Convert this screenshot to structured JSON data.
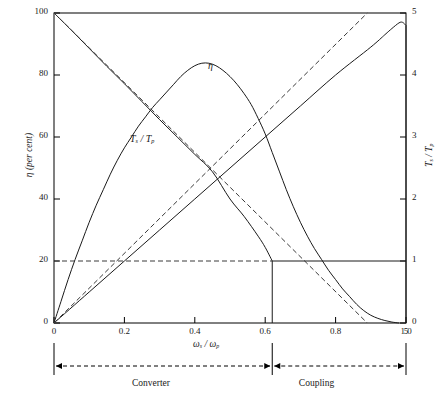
{
  "chart_data": {
    "type": "line",
    "title": "",
    "xlabel": "ωₛ / ωₚ",
    "ylabel": "η (per cent)",
    "ylabel_right": "Tₛ / Tₚ",
    "xlim": [
      0,
      1.0
    ],
    "ylim": [
      0,
      100
    ],
    "ylim_right": [
      0,
      5
    ],
    "grid": false,
    "legend": "in-plot curve labels",
    "x_ticks": [
      "0",
      "0.2",
      "0.4",
      "0.6",
      "0.8",
      "1.0"
    ],
    "x_tick_values": [
      0,
      0.2,
      0.4,
      0.6,
      0.8,
      1.0
    ],
    "y_ticks_left": [
      "0",
      "20",
      "40",
      "60",
      "80",
      "100"
    ],
    "y_tick_values_left": [
      0,
      20,
      40,
      60,
      80,
      100
    ],
    "y_ticks_right": [
      "0",
      "1",
      "2",
      "3",
      "4",
      "5"
    ],
    "y_tick_values_right": [
      0,
      1,
      2,
      3,
      4,
      5
    ],
    "series": [
      {
        "name": "η",
        "style": "solid",
        "axis": "left",
        "label": "η",
        "label_x": 0.52,
        "label_y": 82,
        "points": [
          [
            0.0,
            0.0
          ],
          [
            0.02,
            7.0
          ],
          [
            0.04,
            14.0
          ],
          [
            0.06,
            20.5
          ],
          [
            0.08,
            26.5
          ],
          [
            0.1,
            32.5
          ],
          [
            0.12,
            38.0
          ],
          [
            0.14,
            43.0
          ],
          [
            0.16,
            48.0
          ],
          [
            0.18,
            52.5
          ],
          [
            0.2,
            56.5
          ],
          [
            0.22,
            60.0
          ],
          [
            0.24,
            63.5
          ],
          [
            0.26,
            66.5
          ],
          [
            0.28,
            69.5
          ],
          [
            0.3,
            72.0
          ],
          [
            0.32,
            74.5
          ],
          [
            0.34,
            77.0
          ],
          [
            0.36,
            79.5
          ],
          [
            0.38,
            81.5
          ],
          [
            0.4,
            83.0
          ],
          [
            0.42,
            83.8
          ],
          [
            0.44,
            83.8
          ],
          [
            0.46,
            83.0
          ],
          [
            0.48,
            81.5
          ],
          [
            0.5,
            79.5
          ],
          [
            0.52,
            77.0
          ],
          [
            0.54,
            74.0
          ],
          [
            0.56,
            70.5
          ],
          [
            0.58,
            66.0
          ],
          [
            0.6,
            61.0
          ],
          [
            0.62,
            55.0
          ],
          [
            0.64,
            49.0
          ],
          [
            0.66,
            43.0
          ],
          [
            0.68,
            37.5
          ],
          [
            0.7,
            32.5
          ],
          [
            0.72,
            28.0
          ],
          [
            0.74,
            24.0
          ],
          [
            0.76,
            20.5
          ],
          [
            0.78,
            17.0
          ],
          [
            0.8,
            14.0
          ],
          [
            0.82,
            11.0
          ],
          [
            0.84,
            8.5
          ],
          [
            0.86,
            6.0
          ],
          [
            0.88,
            4.0
          ],
          [
            0.9,
            2.5
          ],
          [
            0.92,
            1.5
          ],
          [
            0.94,
            0.8
          ],
          [
            0.96,
            0.3
          ],
          [
            0.98,
            0.0
          ]
        ]
      },
      {
        "name": "T_s / T_p",
        "style": "solid",
        "axis": "right",
        "label": "Tₛ / Tₚ",
        "label_x": 0.24,
        "label_y_right": 3.0,
        "points": [
          [
            0.0,
            5.0
          ],
          [
            0.05,
            4.72
          ],
          [
            0.1,
            4.43
          ],
          [
            0.15,
            4.14
          ],
          [
            0.2,
            3.86
          ],
          [
            0.25,
            3.57
          ],
          [
            0.3,
            3.28
          ],
          [
            0.35,
            3.0
          ],
          [
            0.4,
            2.72
          ],
          [
            0.45,
            2.44
          ],
          [
            0.5,
            2.0
          ],
          [
            0.54,
            1.72
          ],
          [
            0.58,
            1.4
          ],
          [
            0.6,
            1.22
          ],
          [
            0.62,
            1.0
          ]
        ]
      },
      {
        "name": "output-power-rising",
        "style": "solid",
        "axis": "left",
        "points": [
          [
            0.0,
            0.0
          ],
          [
            0.1,
            10.0
          ],
          [
            0.2,
            20.0
          ],
          [
            0.3,
            30.0
          ],
          [
            0.4,
            40.0
          ],
          [
            0.5,
            50.0
          ],
          [
            0.6,
            60.0
          ],
          [
            0.7,
            70.0
          ],
          [
            0.8,
            80.0
          ],
          [
            0.9,
            89.0
          ],
          [
            0.94,
            93.0
          ],
          [
            0.96,
            95.0
          ],
          [
            0.98,
            96.8
          ],
          [
            0.99,
            97.0
          ],
          [
            1.0,
            96.0
          ]
        ]
      },
      {
        "name": "drop-to-zero-at-unity",
        "style": "solid",
        "axis": "left",
        "points": [
          [
            1.0,
            96.0
          ],
          [
            1.0,
            0.0
          ]
        ]
      },
      {
        "name": "dashed-rising",
        "style": "dashed",
        "axis": "left",
        "points": [
          [
            0.0,
            0.0
          ],
          [
            0.89,
            100.0
          ]
        ]
      },
      {
        "name": "dashed-falling",
        "style": "dashed",
        "axis": "left",
        "points": [
          [
            0.0,
            100.0
          ],
          [
            0.89,
            0.0
          ]
        ]
      },
      {
        "name": "reference-line-unity-torque",
        "style": "dashed-then-solid",
        "axis": "right",
        "value_right": 1.0,
        "value_left": 20.0,
        "dashed_from_x": 0.0,
        "dashed_to_x": 0.62,
        "solid_from_x": 0.62,
        "solid_to_x": 1.0
      },
      {
        "name": "coupling-point-vertical",
        "style": "solid",
        "axis": "left",
        "points": [
          [
            0.62,
            20.0
          ],
          [
            0.62,
            0.0
          ]
        ]
      }
    ],
    "annotations": [
      {
        "name": "converter-region",
        "text": "Converter",
        "from_x": 0.0,
        "to_x": 0.62
      },
      {
        "name": "coupling-region",
        "text": "Coupling",
        "from_x": 0.62,
        "to_x": 1.0
      }
    ],
    "colors": {
      "axis": "#000000",
      "curve": "#1a1a1a",
      "dashed": "#3a3a3a",
      "background": "#ffffff"
    }
  },
  "axes": {
    "left_title": "η (per cent)",
    "right_title_num": "T",
    "right_title_sub1": "s",
    "right_title_den": "T",
    "right_title_sub2": "p",
    "x_title_num": "ω",
    "x_title_sub1": "s",
    "x_title_den": "ω",
    "x_title_sub2": "p",
    "left_ticks": [
      "100",
      "80",
      "60",
      "40",
      "20",
      "0"
    ],
    "right_ticks": [
      "5",
      "4",
      "3",
      "2",
      "1",
      "0"
    ],
    "x_ticks": [
      "0",
      "0.2",
      "0.4",
      "0.6",
      "0.8",
      "1.0"
    ]
  },
  "curve_labels": {
    "eta": "η",
    "torque_num": "T",
    "torque_sub1": "s",
    "torque_den": "T",
    "torque_sub2": "p"
  },
  "regions": {
    "converter": "Converter",
    "coupling": "Coupling"
  }
}
